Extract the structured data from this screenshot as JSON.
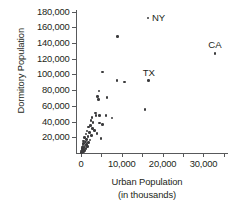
{
  "chart_data": {
    "type": "scatter",
    "title": "",
    "xlabel": "Urban Population",
    "xlabel_sub": "(in thousands)",
    "ylabel": "Dormitory Population",
    "xlim": [
      -1200,
      36000
    ],
    "ylim": [
      0,
      182000
    ],
    "grid": false,
    "legend": false,
    "xticks": [
      0,
      10000,
      20000,
      30000
    ],
    "xtick_labels": [
      "0",
      "10,000",
      "20,000",
      "30,000"
    ],
    "x_minor_ticks": [
      5000,
      15000,
      25000,
      35000
    ],
    "yticks": [
      20000,
      40000,
      60000,
      80000,
      100000,
      120000,
      140000,
      160000,
      180000
    ],
    "ytick_labels": [
      "20,000",
      "40,000",
      "60,000",
      "80,000",
      "100,000",
      "120,000",
      "140,000",
      "160,000",
      "180,000"
    ],
    "marker": "circle",
    "marker_color": "#3b3b3d",
    "axis_color": "#58595b",
    "points": [
      {
        "x": 16400,
        "y": 172000,
        "label": "NY",
        "label_pos": "right"
      },
      {
        "x": 32800,
        "y": 127000,
        "label": "CA",
        "label_pos": "above"
      },
      {
        "x": 16600,
        "y": 92000,
        "label": "TX",
        "label_pos": "above"
      },
      {
        "x": 8900,
        "y": 148000,
        "label": ""
      },
      {
        "x": 5300,
        "y": 103000,
        "label": ""
      },
      {
        "x": 8800,
        "y": 92000,
        "label": ""
      },
      {
        "x": 10700,
        "y": 90500,
        "label": ""
      },
      {
        "x": 4400,
        "y": 79000,
        "label": ""
      },
      {
        "x": 4000,
        "y": 72000,
        "label": ""
      },
      {
        "x": 4300,
        "y": 68000,
        "label": ""
      },
      {
        "x": 6400,
        "y": 70500,
        "label": ""
      },
      {
        "x": 15700,
        "y": 55000,
        "label": ""
      },
      {
        "x": 3500,
        "y": 51000,
        "label": ""
      },
      {
        "x": 3700,
        "y": 48000,
        "label": ""
      },
      {
        "x": 4500,
        "y": 48000,
        "label": ""
      },
      {
        "x": 6100,
        "y": 47500,
        "label": ""
      },
      {
        "x": 7600,
        "y": 44500,
        "label": ""
      },
      {
        "x": 2700,
        "y": 45000,
        "label": ""
      },
      {
        "x": 2500,
        "y": 41000,
        "label": ""
      },
      {
        "x": 3000,
        "y": 38500,
        "label": ""
      },
      {
        "x": 4600,
        "y": 38000,
        "label": ""
      },
      {
        "x": 5300,
        "y": 36000,
        "label": ""
      },
      {
        "x": 2300,
        "y": 35000,
        "label": ""
      },
      {
        "x": 1900,
        "y": 33000,
        "label": ""
      },
      {
        "x": 2900,
        "y": 31000,
        "label": ""
      },
      {
        "x": 3400,
        "y": 29000,
        "label": ""
      },
      {
        "x": 1500,
        "y": 28000,
        "label": ""
      },
      {
        "x": 2100,
        "y": 26000,
        "label": ""
      },
      {
        "x": 3900,
        "y": 24500,
        "label": ""
      },
      {
        "x": 1200,
        "y": 24000,
        "label": ""
      },
      {
        "x": 2600,
        "y": 22000,
        "label": ""
      },
      {
        "x": 1700,
        "y": 21000,
        "label": ""
      },
      {
        "x": 900,
        "y": 20000,
        "label": ""
      },
      {
        "x": 4900,
        "y": 18500,
        "label": ""
      },
      {
        "x": 1400,
        "y": 17500,
        "label": ""
      },
      {
        "x": 2200,
        "y": 16500,
        "label": ""
      },
      {
        "x": 700,
        "y": 15500,
        "label": ""
      },
      {
        "x": 1100,
        "y": 14000,
        "label": ""
      },
      {
        "x": 1800,
        "y": 13000,
        "label": ""
      },
      {
        "x": 600,
        "y": 12000,
        "label": ""
      },
      {
        "x": 1300,
        "y": 11000,
        "label": ""
      },
      {
        "x": 500,
        "y": 10000,
        "label": ""
      },
      {
        "x": 1000,
        "y": 9000,
        "label": ""
      },
      {
        "x": 1600,
        "y": 8500,
        "label": ""
      },
      {
        "x": 400,
        "y": 7500,
        "label": ""
      },
      {
        "x": 800,
        "y": 7000,
        "label": ""
      },
      {
        "x": 300,
        "y": 6000,
        "label": ""
      },
      {
        "x": 1200,
        "y": 5500,
        "label": ""
      },
      {
        "x": 600,
        "y": 5000,
        "label": ""
      },
      {
        "x": 250,
        "y": 4000,
        "label": ""
      },
      {
        "x": 900,
        "y": 3500,
        "label": ""
      },
      {
        "x": 450,
        "y": 3000,
        "label": ""
      },
      {
        "x": 200,
        "y": 2500,
        "label": ""
      },
      {
        "x": 700,
        "y": 2000,
        "label": ""
      },
      {
        "x": 350,
        "y": 1500,
        "label": ""
      },
      {
        "x": 150,
        "y": 1000,
        "label": ""
      }
    ]
  }
}
